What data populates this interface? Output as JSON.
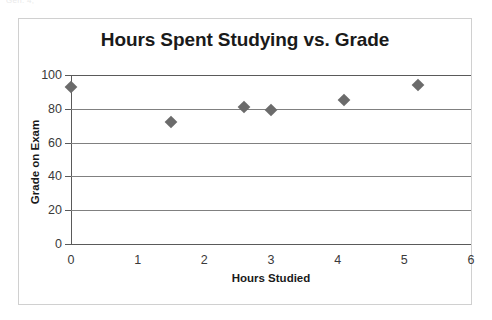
{
  "artifact_text": "Gen. 4,",
  "chart_data": {
    "type": "scatter",
    "title": "Hours Spent Studying vs. Grade",
    "xlabel": "Hours Studied",
    "ylabel": "Grade on Exam",
    "xlim": [
      0,
      6
    ],
    "ylim": [
      0,
      100
    ],
    "xticks": [
      "0",
      "1",
      "2",
      "3",
      "4",
      "5",
      "6"
    ],
    "xtick_values": [
      0,
      1,
      2,
      3,
      4,
      5,
      6
    ],
    "yticks": [
      "0",
      "20",
      "40",
      "60",
      "80",
      "100"
    ],
    "ytick_values": [
      0,
      20,
      40,
      60,
      80,
      100
    ],
    "grid": "horizontal",
    "legend": "none",
    "marker": "diamond",
    "marker_color": "#6b6b6b",
    "points": [
      {
        "x": 0,
        "y": 93
      },
      {
        "x": 1.5,
        "y": 72
      },
      {
        "x": 2.6,
        "y": 81
      },
      {
        "x": 3.0,
        "y": 79
      },
      {
        "x": 4.1,
        "y": 85
      },
      {
        "x": 5.2,
        "y": 94
      }
    ]
  }
}
